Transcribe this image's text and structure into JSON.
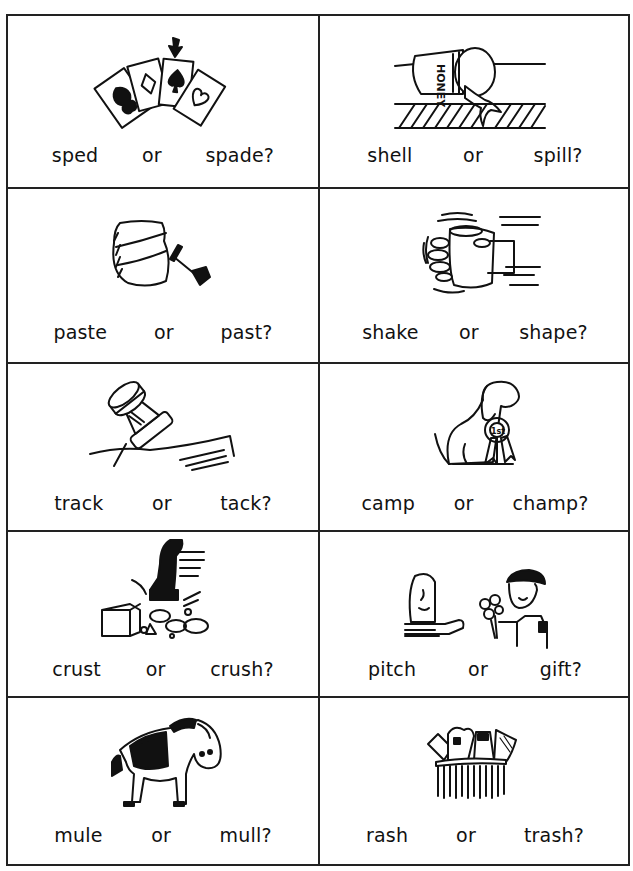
{
  "worksheet": {
    "connector": "or",
    "cells": [
      {
        "id": "cards",
        "picture": "playing-cards-with-arrow-at-spade",
        "choice_a": "sped",
        "choice_b": "spade?"
      },
      {
        "id": "honey",
        "picture": "tipped-honey-jar-spilling",
        "choice_a": "shell",
        "choice_b": "spill?",
        "jar_label": "HONEY"
      },
      {
        "id": "paste",
        "picture": "paste-jar-with-brush",
        "choice_a": "paste",
        "choice_b": "past?"
      },
      {
        "id": "shake",
        "picture": "hand-shaking-jar",
        "choice_a": "shake",
        "choice_b": "shape?"
      },
      {
        "id": "tack",
        "picture": "thumbtack-in-wood",
        "choice_a": "track",
        "choice_b": "tack?"
      },
      {
        "id": "champ",
        "picture": "dog-with-first-prize-ribbon",
        "choice_a": "camp",
        "choice_b": "champ?",
        "ribbon_label": "1st"
      },
      {
        "id": "crush",
        "picture": "hammer-crushing-rocks",
        "choice_a": "crust",
        "choice_b": "crush?"
      },
      {
        "id": "gift",
        "picture": "boy-giving-flowers-to-girl",
        "choice_a": "pitch",
        "choice_b": "gift?"
      },
      {
        "id": "mule",
        "picture": "mule",
        "choice_a": "mule",
        "choice_b": "mull?"
      },
      {
        "id": "trash",
        "picture": "overflowing-trash-can",
        "choice_a": "rash",
        "choice_b": "trash?"
      }
    ]
  }
}
